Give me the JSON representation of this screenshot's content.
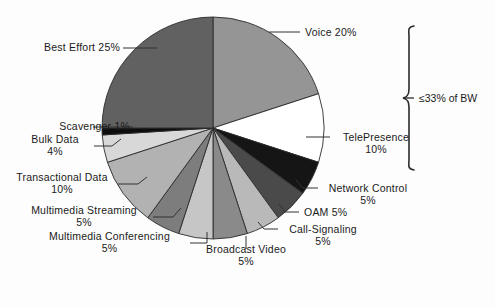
{
  "figure": {
    "background": "#fdfdfd",
    "annotation": {
      "text": "≤33% of BW",
      "name": "bandwidth-bracket-label"
    }
  },
  "chart_data": {
    "type": "pie",
    "title": "",
    "start_angle_deg": 0,
    "direction": "clockwise",
    "center": [
      213,
      128
    ],
    "radius": 111,
    "stroke": "#2b2b2b",
    "labels": [
      "Voice 20%",
      "TelePresence\n10%",
      "Network Control\n5%",
      "OAM 5%",
      "Call-Signaling\n5%",
      "Broadcast Video\n5%",
      "Multimedia Conferencing\n5%",
      "Multimedia Streaming\n5%",
      "Transactional Data\n10%",
      "Bulk Data\n4%",
      "Scavenger 1%",
      "Best Effort 25%"
    ],
    "categories": [
      "Voice",
      "TelePresence",
      "Network Control",
      "OAM",
      "Call-Signaling",
      "Broadcast Video",
      "Multimedia Conferencing",
      "Multimedia Streaming",
      "Transactional Data",
      "Bulk Data",
      "Scavenger",
      "Best Effort"
    ],
    "values": [
      20,
      10,
      5,
      5,
      5,
      5,
      5,
      5,
      10,
      4,
      1,
      25
    ],
    "value_labels": [
      "20%",
      "10%",
      "5%",
      "5%",
      "5%",
      "5%",
      "5%",
      "5%",
      "10%",
      "4%",
      "1%",
      "25%"
    ],
    "colors": [
      "#959595",
      "#ffffff",
      "#151515",
      "#4a4a4a",
      "#b9b9b9",
      "#8a8a8a",
      "#c6c6c6",
      "#7d7d7d",
      "#b2b2b2",
      "#d8d8d8",
      "#0d0d0d",
      "#616161"
    ],
    "legend": "none",
    "grid": false,
    "units": "percent of bandwidth"
  },
  "labels": {
    "voice": "Voice 20%",
    "telepresence_name": "TelePresence",
    "telepresence_pct": "10%",
    "network_control_name": "Network Control",
    "network_control_pct": "5%",
    "oam": "OAM 5%",
    "call_signaling_name": "Call-Signaling",
    "call_signaling_pct": "5%",
    "broadcast_video_name": "Broadcast Video",
    "broadcast_video_pct": "5%",
    "mm_conferencing_name": "Multimedia Conferencing",
    "mm_conferencing_pct": "5%",
    "mm_streaming_name": "Multimedia Streaming",
    "mm_streaming_pct": "5%",
    "transactional_name": "Transactional Data",
    "transactional_pct": "10%",
    "bulk_data_name": "Bulk Data",
    "bulk_data_pct": "4%",
    "scavenger": "Scavenger 1%",
    "best_effort": "Best Effort 25%",
    "bandwidth_note": "≤33% of BW"
  }
}
